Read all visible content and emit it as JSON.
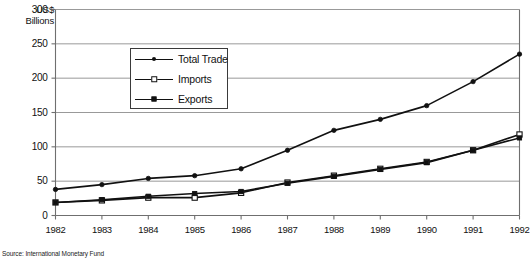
{
  "chart_data": {
    "type": "line",
    "title": "",
    "subtitle": "",
    "ylabel": "US$ Billions",
    "xlabel": "",
    "categories": [
      "1982",
      "1983",
      "1984",
      "1985",
      "1986",
      "1987",
      "1988",
      "1989",
      "1990",
      "1991",
      "1992"
    ],
    "x": [
      1982,
      1983,
      1984,
      1985,
      1986,
      1987,
      1988,
      1989,
      1990,
      1991,
      1992
    ],
    "ylim": [
      0,
      300
    ],
    "yticks": [
      0,
      50,
      100,
      150,
      200,
      250,
      300
    ],
    "grid": true,
    "legend_position": "inside-upper-left",
    "series": [
      {
        "name": "Total Trade",
        "marker": "dot",
        "color": "#111111",
        "values": [
          38,
          45,
          54,
          58,
          68,
          95,
          124,
          140,
          160,
          195,
          235
        ]
      },
      {
        "name": "Imports",
        "marker": "open-square",
        "color": "#111111",
        "values": [
          19,
          22,
          26,
          26,
          33,
          48,
          58,
          68,
          78,
          95,
          118
        ]
      },
      {
        "name": "Exports",
        "marker": "filled-square",
        "color": "#111111",
        "values": [
          19,
          23,
          28,
          32,
          35,
          47,
          57,
          67,
          77,
          95,
          113
        ]
      }
    ],
    "annotations": {
      "source": "Source: International Monetary Fund"
    }
  },
  "axis": {
    "ylabel_line1": "US$",
    "ylabel_line2": "Billions",
    "ytick_labels": [
      "300",
      "250",
      "200",
      "150",
      "100",
      "50",
      "0"
    ],
    "xtick_labels": [
      "1982",
      "1983",
      "1984",
      "1985",
      "1986",
      "1987",
      "1988",
      "1989",
      "1990",
      "1991",
      "1992"
    ]
  },
  "legend": {
    "items": [
      {
        "label": "Total Trade",
        "marker": "dot-marker-icon"
      },
      {
        "label": "Imports",
        "marker": "open-square-marker-icon"
      },
      {
        "label": "Exports",
        "marker": "filled-square-marker-icon"
      }
    ]
  },
  "footer": {
    "source": "Source: International Monetary Fund"
  }
}
